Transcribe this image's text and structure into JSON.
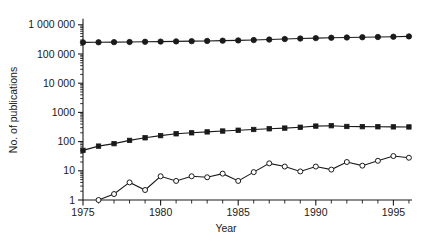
{
  "chart_data": {
    "type": "line",
    "title": "",
    "xlabel": "Year",
    "ylabel": "No. of publications",
    "xlim": [
      1975,
      1996
    ],
    "ylim": [
      1,
      1000000
    ],
    "yscale": "log",
    "grid": false,
    "legend": "none",
    "x_tick_labels": [
      "1975",
      "1980",
      "1985",
      "1990",
      "1995"
    ],
    "x_tick_values": [
      1975,
      1980,
      1985,
      1990,
      1995
    ],
    "x_minor_ticks_every": 1,
    "y_tick_labels": [
      "1",
      "10",
      "100",
      "1000",
      "10 000",
      "100 000",
      "1 000 000"
    ],
    "y_tick_values": [
      1,
      10,
      100,
      1000,
      10000,
      100000,
      1000000
    ],
    "x": [
      1975,
      1976,
      1977,
      1978,
      1979,
      1980,
      1981,
      1982,
      1983,
      1984,
      1985,
      1986,
      1987,
      1988,
      1989,
      1990,
      1991,
      1992,
      1993,
      1994,
      1995,
      1996
    ],
    "series": [
      {
        "name": "All publications",
        "marker": "filled-circle",
        "values": [
          250000,
          252000,
          255000,
          258000,
          262000,
          266000,
          270000,
          275000,
          280000,
          286000,
          292000,
          300000,
          312000,
          325000,
          338000,
          350000,
          360000,
          368000,
          375000,
          382000,
          390000,
          400000
        ]
      },
      {
        "name": "Topic publications",
        "marker": "filled-square",
        "values": [
          50,
          70,
          85,
          110,
          135,
          160,
          185,
          200,
          215,
          230,
          245,
          260,
          275,
          290,
          310,
          340,
          350,
          330,
          325,
          322,
          320,
          318
        ]
      },
      {
        "name": "Subtopic publications",
        "marker": "open-circle",
        "values": [
          null,
          1,
          1.6,
          4.0,
          2.2,
          6.5,
          4.5,
          6.5,
          6.0,
          8.0,
          4.5,
          9.0,
          18.0,
          14.0,
          9.5,
          14.0,
          11.0,
          20.0,
          15.0,
          22.0,
          32.0,
          28.0
        ]
      }
    ]
  },
  "geometry": {
    "plot_left": 83,
    "plot_right": 412,
    "plot_bottom": 200,
    "decade_px": 29.2,
    "year_px": 15.52
  }
}
